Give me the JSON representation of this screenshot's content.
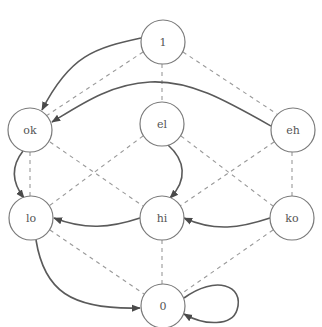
{
  "diagram": {
    "colors": {
      "background": "#ffffff",
      "node_stroke": "#7a7a7a",
      "label": "#555555",
      "lattice_edge": "#9a9a9a",
      "transition_edge": "#5a5a5a",
      "arrowhead": "#4a4a4a"
    },
    "nodes": [
      {
        "id": "1",
        "label": "1",
        "x": 163,
        "y": 42,
        "r": 22
      },
      {
        "id": "ok",
        "label": "ok",
        "x": 30,
        "y": 130,
        "r": 22
      },
      {
        "id": "el",
        "label": "el",
        "x": 162,
        "y": 124,
        "r": 22
      },
      {
        "id": "eh",
        "label": "eh",
        "x": 293,
        "y": 130,
        "r": 22
      },
      {
        "id": "lo",
        "label": "lo",
        "x": 31,
        "y": 218,
        "r": 22
      },
      {
        "id": "hi",
        "label": "hi",
        "x": 162,
        "y": 218,
        "r": 22
      },
      {
        "id": "ko",
        "label": "ko",
        "x": 292,
        "y": 218,
        "r": 22
      },
      {
        "id": "0",
        "label": "0",
        "x": 163,
        "y": 306,
        "r": 22
      }
    ],
    "lattice_edges": [
      [
        "1",
        "ok"
      ],
      [
        "1",
        "el"
      ],
      [
        "1",
        "eh"
      ],
      [
        "ok",
        "lo"
      ],
      [
        "ok",
        "hi"
      ],
      [
        "el",
        "lo"
      ],
      [
        "el",
        "ko"
      ],
      [
        "eh",
        "hi"
      ],
      [
        "eh",
        "ko"
      ],
      [
        "lo",
        "0"
      ],
      [
        "hi",
        "0"
      ],
      [
        "ko",
        "0"
      ]
    ],
    "transitions": [
      {
        "from": "1",
        "to": "ok"
      },
      {
        "from": "eh",
        "to": "ok"
      },
      {
        "from": "ok",
        "to": "lo"
      },
      {
        "from": "el",
        "to": "hi"
      },
      {
        "from": "hi",
        "to": "lo"
      },
      {
        "from": "ko",
        "to": "hi"
      },
      {
        "from": "lo",
        "to": "0"
      },
      {
        "from": "0",
        "to": "0"
      }
    ]
  }
}
